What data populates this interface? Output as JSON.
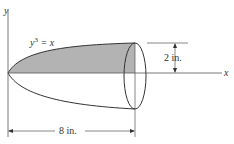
{
  "diagram": {
    "curve_label": "y",
    "curve_exp": "3",
    "curve_rhs": " = x",
    "y_axis_label": "y",
    "x_axis_label": "x",
    "radius_dim": "2 in.",
    "length_dim": "8 in.",
    "shade_color": "#b3b3b3",
    "line_color": "#333333"
  }
}
